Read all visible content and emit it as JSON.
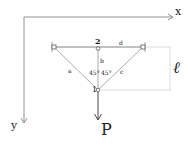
{
  "diagram": {
    "type": "truss-structure",
    "axes": {
      "x_label": "x",
      "y_label": "y"
    },
    "nodes": {
      "node_1": {
        "label": "1"
      },
      "node_2": {
        "label": "2"
      }
    },
    "members": {
      "a": "a",
      "b": "b",
      "c": "c",
      "d": "d"
    },
    "angles": {
      "left": "45°",
      "right": "45°"
    },
    "dimension": {
      "label": "ℓ"
    },
    "load": {
      "label": "P"
    },
    "colors": {
      "line": "#555555",
      "dimension_line": "#cfcfcf",
      "text": "#222222"
    }
  }
}
